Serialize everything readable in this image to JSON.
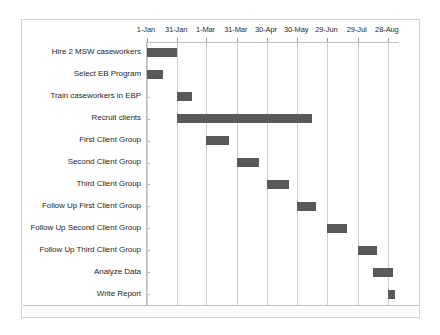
{
  "chart_data": {
    "type": "bar",
    "orientation": "horizontal",
    "subtype": "gantt",
    "title": "",
    "xlabel": "",
    "ylabel": "",
    "grid": true,
    "legend": "none",
    "bar_color": "#595959",
    "gridline_color": "#cfcfcf",
    "border_color": "#d4d4d4",
    "x_axis": {
      "position": "top",
      "tick_labels": [
        "1-Jan",
        "31-Jan",
        "1-Mar",
        "31-Mar",
        "30-Apr",
        "30-May",
        "29-Jun",
        "29-Jul",
        "28-Aug"
      ],
      "tick_values": [
        0,
        30,
        59,
        89,
        119,
        149,
        179,
        209,
        239
      ],
      "xlim": [
        0,
        250
      ],
      "unit": "days from 1-Jan"
    },
    "categories": [
      "Hire 2 MSW caseworkers",
      "Select EB Program",
      "Train caseworkers in EBP",
      "Recruit clients",
      "First Client Group",
      "Second Client Group",
      "Third Client Group",
      "Follow Up First Client Group",
      "Follow Up Second Client Group",
      "Follow Up Third Client Group",
      "Analyze Data",
      "Write Report"
    ],
    "tasks": [
      {
        "name": "Hire 2 MSW caseworkers",
        "start": 0,
        "end": 30,
        "start_label": "1-Jan",
        "end_label": "31-Jan",
        "duration": 30
      },
      {
        "name": "Select EB Program",
        "start": 0,
        "end": 16,
        "start_label": "1-Jan",
        "end_label": "17-Jan",
        "duration": 16
      },
      {
        "name": "Train caseworkers in EBP",
        "start": 30,
        "end": 45,
        "start_label": "31-Jan",
        "end_label": "15-Feb",
        "duration": 15
      },
      {
        "name": "Recruit clients",
        "start": 30,
        "end": 164,
        "start_label": "31-Jan",
        "end_label": "14-Jun",
        "duration": 134
      },
      {
        "name": "First Client Group",
        "start": 59,
        "end": 81,
        "start_label": "1-Mar",
        "end_label": "23-Mar",
        "duration": 22
      },
      {
        "name": "Second Client Group",
        "start": 89,
        "end": 111,
        "start_label": "31-Mar",
        "end_label": "22-Apr",
        "duration": 22
      },
      {
        "name": "Third Client Group",
        "start": 119,
        "end": 141,
        "start_label": "30-Apr",
        "end_label": "22-May",
        "duration": 22
      },
      {
        "name": "Follow Up First Client Group",
        "start": 149,
        "end": 168,
        "start_label": "30-May",
        "end_label": "18-Jun",
        "duration": 19
      },
      {
        "name": "Follow Up Second Client Group",
        "start": 179,
        "end": 198,
        "start_label": "29-Jun",
        "end_label": "18-Jul",
        "duration": 19
      },
      {
        "name": "Follow Up Third Client Group",
        "start": 209,
        "end": 228,
        "start_label": "29-Jul",
        "end_label": "17-Aug",
        "duration": 19
      },
      {
        "name": "Analyze Data",
        "start": 224,
        "end": 244,
        "start_label": "12-Aug",
        "end_label": "1-Sep",
        "duration": 20
      },
      {
        "name": "Write Report",
        "start": 239,
        "end": 246,
        "start_label": "28-Aug",
        "end_label": "4-Sep",
        "duration": 7
      }
    ]
  }
}
